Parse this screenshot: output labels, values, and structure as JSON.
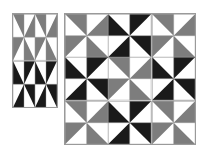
{
  "figure": {
    "background_color": "#ffffff",
    "border_color": "#9a9a9a",
    "grid_line_color": "#9a9a9a",
    "colors": {
      "white": "#ffffff",
      "gray": "#7d7d7d",
      "black": "#1a1a1a"
    }
  },
  "panels": [
    {
      "name": "left-panel",
      "rows": 2,
      "cols": 2,
      "blocks": [
        {
          "id": "L-r0-c0",
          "background": "#ffffff",
          "triangle": "#7d7d7d"
        },
        {
          "id": "L-r0-c1",
          "background": "#ffffff",
          "triangle": "#7d7d7d"
        },
        {
          "id": "L-r1-c0",
          "background": "#1a1a1a",
          "triangle": "#ffffff"
        },
        {
          "id": "L-r1-c1",
          "background": "#1a1a1a",
          "triangle": "#ffffff"
        }
      ]
    },
    {
      "name": "right-panel",
      "rows": 3,
      "cols": 3,
      "blocks": [
        {
          "id": "R-r0-c0",
          "background": "#ffffff",
          "triangle": "#7d7d7d"
        },
        {
          "id": "R-r0-c1",
          "background": "#1a1a1a",
          "triangle": "#ffffff"
        },
        {
          "id": "R-r0-c2",
          "background": "#ffffff",
          "triangle": "#7d7d7d"
        },
        {
          "id": "R-r1-c0",
          "background": "#1a1a1a",
          "triangle": "#ffffff"
        },
        {
          "id": "R-r1-c1",
          "background": "#ffffff",
          "triangle": "#7d7d7d"
        },
        {
          "id": "R-r1-c2",
          "background": "#1a1a1a",
          "triangle": "#ffffff"
        },
        {
          "id": "R-r2-c0",
          "background": "#ffffff",
          "triangle": "#7d7d7d"
        },
        {
          "id": "R-r2-c1",
          "background": "#1a1a1a",
          "triangle": "#ffffff"
        },
        {
          "id": "R-r2-c2",
          "background": "#ffffff",
          "triangle": "#7d7d7d"
        }
      ]
    }
  ]
}
